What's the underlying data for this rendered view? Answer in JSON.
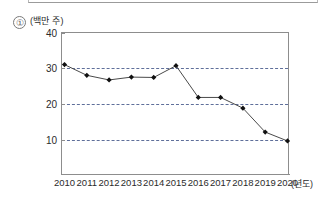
{
  "figure": {
    "index_marker": "①",
    "unit_label": "(백만 주)",
    "x_axis_unit": "(년도)"
  },
  "chart_data": {
    "type": "line",
    "title": "",
    "subtitle": "",
    "xlabel": "(년도)",
    "ylabel": "(백만 주)",
    "categories": [
      "2010",
      "2011",
      "2012",
      "2013",
      "2014",
      "2015",
      "2016",
      "2017",
      "2018",
      "2019",
      "2020"
    ],
    "x": [
      2010,
      2011,
      2012,
      2013,
      2014,
      2015,
      2016,
      2017,
      2018,
      2019,
      2020
    ],
    "values": [
      31.0,
      28.0,
      26.7,
      27.5,
      27.4,
      30.7,
      21.8,
      21.8,
      18.8,
      12.1,
      9.6
    ],
    "series": [
      {
        "name": "발행 주식 수",
        "values": [
          31.0,
          28.0,
          26.7,
          27.5,
          27.4,
          30.7,
          21.8,
          21.8,
          18.8,
          12.1,
          9.6
        ]
      }
    ],
    "ylim": [
      0,
      40
    ],
    "yticks": [
      10,
      20,
      30,
      40
    ],
    "ytick_labels": [
      "10",
      "20",
      "30",
      "40"
    ],
    "xtick_labels": [
      "2010",
      "2011",
      "2012",
      "2013",
      "2014",
      "2015",
      "2016",
      "2017",
      "2018",
      "2019",
      "2020"
    ],
    "grid": true,
    "grid_axis": "y",
    "grid_style": "dashed",
    "legend": false,
    "legend_position": "none",
    "marker": "diamond",
    "marker_color": "#111111",
    "line_color": "#4a4a4a",
    "grid_color": "#5f6f9a",
    "axis_color": "#8d8d8d",
    "background": "#ffffff",
    "annotations": []
  }
}
